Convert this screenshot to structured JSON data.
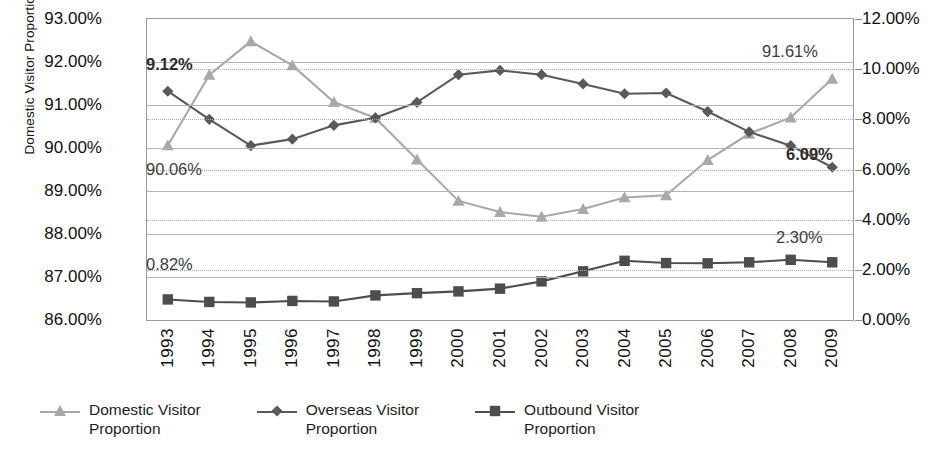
{
  "axes": {
    "left_title": "Domestic Visitor Proportion",
    "left_ticks": [
      "93.00%",
      "92.00%",
      "91.00%",
      "90.00%",
      "89.00%",
      "88.00%",
      "87.00%",
      "86.00%"
    ],
    "right_ticks": [
      "12.00%",
      "10.00%",
      "8.00%",
      "6.00%",
      "4.00%",
      "2.00%",
      "0.00%"
    ]
  },
  "legend": [
    {
      "label_line1": "Domestic Visitor",
      "label_line2": "Proportion",
      "color": "#a8a8a8",
      "marker": "triangle",
      "name": "legend-domestic"
    },
    {
      "label_line1": "Overseas Visitor",
      "label_line2": "Proportion",
      "color": "#595959",
      "marker": "diamond",
      "name": "legend-overseas"
    },
    {
      "label_line1": "Outbound Visitor",
      "label_line2": "Proportion",
      "color": "#4d4d4d",
      "marker": "square",
      "name": "legend-outbound"
    }
  ],
  "annotations": [
    {
      "text": "9.12%",
      "x": 146,
      "y": 55,
      "bold": true,
      "name": "annotation-overseas-start"
    },
    {
      "text": "90.06%",
      "x": 146,
      "y": 160,
      "bold": false,
      "name": "annotation-domestic-start"
    },
    {
      "text": "0.82%",
      "x": 146,
      "y": 255,
      "bold": false,
      "name": "annotation-outbound-start"
    },
    {
      "text": "91.61%",
      "x": 762,
      "y": 42,
      "bold": false,
      "name": "annotation-domestic-end"
    },
    {
      "text": "6.09%",
      "x": 786,
      "y": 145,
      "bold": true,
      "name": "annotation-overseas-end"
    },
    {
      "text": "2.30%",
      "x": 776,
      "y": 228,
      "bold": false,
      "name": "annotation-outbound-end"
    }
  ],
  "chart_data": {
    "type": "line",
    "title": "",
    "xlabel": "",
    "ylabel": "Domestic Visitor Proportion",
    "y2label": "",
    "grid": true,
    "legend_position": "bottom",
    "categories": [
      "1993",
      "1994",
      "1995",
      "1996",
      "1997",
      "1998",
      "1999",
      "2000",
      "2001",
      "2002",
      "2003",
      "2004",
      "2005",
      "2006",
      "2007",
      "2008",
      "2009"
    ],
    "ylim": [
      86.0,
      93.0
    ],
    "y2lim": [
      0.0,
      12.0
    ],
    "series": [
      {
        "name": "Domestic Visitor Proportion",
        "axis": "left",
        "unit": "%",
        "color": "#a8a8a8",
        "marker": "triangle",
        "values": [
          90.06,
          91.7,
          92.48,
          91.92,
          91.07,
          90.7,
          89.73,
          88.77,
          88.51,
          88.4,
          88.58,
          88.85,
          88.9,
          89.72,
          90.33,
          90.71,
          91.61
        ]
      },
      {
        "name": "Overseas Visitor Proportion",
        "axis": "right",
        "unit": "%",
        "color": "#595959",
        "marker": "diamond",
        "values": [
          9.12,
          8.0,
          6.95,
          7.21,
          7.76,
          8.06,
          8.68,
          9.78,
          9.95,
          9.78,
          9.41,
          9.02,
          9.05,
          8.31,
          7.5,
          6.95,
          6.09
        ]
      },
      {
        "name": "Outbound Visitor Proportion",
        "axis": "right",
        "unit": "%",
        "color": "#4d4d4d",
        "marker": "square",
        "values": [
          0.82,
          0.72,
          0.7,
          0.76,
          0.74,
          0.98,
          1.07,
          1.14,
          1.25,
          1.54,
          1.94,
          2.36,
          2.27,
          2.26,
          2.3,
          2.4,
          2.3
        ]
      }
    ]
  }
}
